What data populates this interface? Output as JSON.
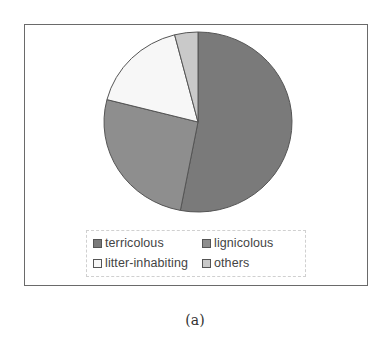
{
  "chart_data": {
    "type": "pie",
    "title": "",
    "caption": "(a)",
    "categories": [
      "terricolous",
      "lignicolous",
      "litter-inhabiting",
      "others"
    ],
    "values": [
      53,
      26,
      17,
      4
    ],
    "unit": "%",
    "start_angle_deg": 0,
    "direction": "clockwise",
    "colors": [
      "#7a7a7a",
      "#8e8e8e",
      "#f7f7f7",
      "#c9c9c9"
    ],
    "legend": {
      "position": "bottom",
      "entries": [
        "terricolous",
        "lignicolous",
        "litter-inhabiting",
        "others"
      ],
      "columns": 2
    },
    "grid": false
  },
  "figure": {
    "caption": "(a)"
  }
}
